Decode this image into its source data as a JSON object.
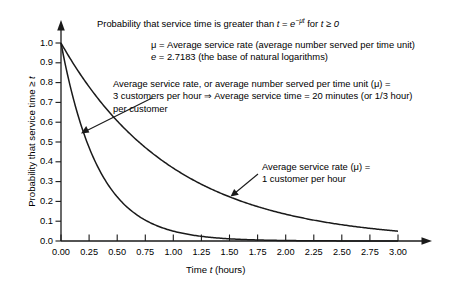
{
  "chart_data": {
    "type": "line",
    "xlabel": "Time t (hours)",
    "ylabel": "Probability that service time ≥ t",
    "xlim": [
      0,
      3
    ],
    "ylim": [
      0,
      1
    ],
    "xticks": [
      "0.00",
      "0.25",
      "0.50",
      "0.75",
      "1.00",
      "1.25",
      "1.50",
      "1.75",
      "2.00",
      "2.25",
      "2.50",
      "2.75",
      "3.00"
    ],
    "xtick_values": [
      0,
      0.25,
      0.5,
      0.75,
      1.0,
      1.25,
      1.5,
      1.75,
      2.0,
      2.25,
      2.5,
      2.75,
      3.0
    ],
    "yticks": [
      "0.0",
      "0.1",
      "0.2",
      "0.3",
      "0.4",
      "0.5",
      "0.6",
      "0.7",
      "0.8",
      "0.9",
      "1.0"
    ],
    "ytick_values": [
      0,
      0.1,
      0.2,
      0.3,
      0.4,
      0.5,
      0.6,
      0.7,
      0.8,
      0.9,
      1.0
    ],
    "grid": false,
    "legend_position": "inline-annotations",
    "line_color": "#1a1a1a",
    "series": [
      {
        "name": "Average service rate (μ) = 1 customer per hour",
        "mu": 1,
        "formula": "e^(-1*t)",
        "x": [
          0,
          0.25,
          0.5,
          0.75,
          1.0,
          1.25,
          1.5,
          1.75,
          2.0,
          2.25,
          2.5,
          2.75,
          3.0
        ],
        "values": [
          1.0,
          0.779,
          0.607,
          0.472,
          0.368,
          0.287,
          0.223,
          0.174,
          0.135,
          0.105,
          0.082,
          0.064,
          0.05
        ]
      },
      {
        "name": "Average service rate (μ) = 3 customers per hour",
        "mu": 3,
        "formula": "e^(-3*t)",
        "x": [
          0,
          0.25,
          0.5,
          0.75,
          1.0,
          1.25,
          1.5,
          1.75,
          2.0,
          2.25,
          2.5,
          2.75,
          3.0
        ],
        "values": [
          1.0,
          0.472,
          0.223,
          0.105,
          0.05,
          0.024,
          0.011,
          0.005,
          0.002,
          0.001,
          0.001,
          0.0,
          0.0
        ]
      }
    ]
  },
  "title": {
    "prefix": "Probability that service time is greater than ",
    "var_t": "t",
    "equals": " = ",
    "base_e": "e",
    "exponent": "−μt",
    "suffix": " for ",
    "condition": "t ≥ 0"
  },
  "definitions": {
    "mu_line": "μ = Average service rate (average number served per time unit)",
    "e_symbol": "e",
    "e_line": " = 2.7183 (the base of natural logarithms)"
  },
  "annotations": {
    "mu3": {
      "line1": "Average service rate, or average number served per time unit (μ) =",
      "line2": "3 customers per hour ⇒ Average service time = 20 minutes (or 1/3 hour)",
      "line3": "per customer"
    },
    "mu1": {
      "line1": "Average service rate (μ) =",
      "line2": "1 customer per hour"
    }
  },
  "axes": {
    "x_title_prefix": "Time ",
    "x_title_var": "t",
    "x_title_suffix": " (hours)",
    "y_title_prefix": "Probability that service time ≥ ",
    "y_title_var": "t"
  }
}
